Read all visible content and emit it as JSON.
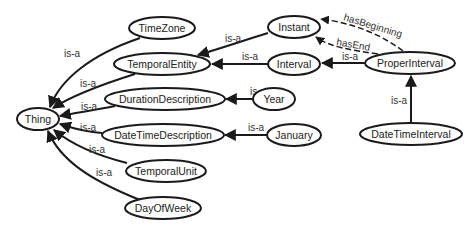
{
  "diagram": {
    "type": "ontology-class-graph",
    "nodes": [
      {
        "id": "TimeZone",
        "label": "TimeZone"
      },
      {
        "id": "Instant",
        "label": "Instant"
      },
      {
        "id": "TemporalEntity",
        "label": "TemporalEntity"
      },
      {
        "id": "Interval",
        "label": "Interval"
      },
      {
        "id": "ProperInterval",
        "label": "ProperInterval"
      },
      {
        "id": "DurationDescription",
        "label": "DurationDescription"
      },
      {
        "id": "Year",
        "label": "Year"
      },
      {
        "id": "Thing",
        "label": "Thing"
      },
      {
        "id": "DateTimeDescription",
        "label": "DateTimeDescription"
      },
      {
        "id": "January",
        "label": "January"
      },
      {
        "id": "DateTimeInterval",
        "label": "DateTimeInterval"
      },
      {
        "id": "TemporalUnit",
        "label": "TemporalUnit"
      },
      {
        "id": "DayOfWeek",
        "label": "DayOfWeek"
      }
    ],
    "edges": [
      {
        "from": "TimeZone",
        "to": "Thing",
        "label": "is-a",
        "style": "solid"
      },
      {
        "from": "TemporalEntity",
        "to": "Thing",
        "label": "is-a",
        "style": "solid"
      },
      {
        "from": "DurationDescription",
        "to": "Thing",
        "label": "is-a",
        "style": "solid"
      },
      {
        "from": "DateTimeDescription",
        "to": "Thing",
        "label": "is-a",
        "style": "solid"
      },
      {
        "from": "TemporalUnit",
        "to": "Thing",
        "label": "is-a",
        "style": "solid"
      },
      {
        "from": "DayOfWeek",
        "to": "Thing",
        "label": "is-a",
        "style": "solid"
      },
      {
        "from": "Instant",
        "to": "TemporalEntity",
        "label": "is-a",
        "style": "solid"
      },
      {
        "from": "Interval",
        "to": "TemporalEntity",
        "label": "is-a",
        "style": "solid"
      },
      {
        "from": "ProperInterval",
        "to": "Interval",
        "label": "is-a",
        "style": "solid"
      },
      {
        "from": "Year",
        "to": "DurationDescription",
        "label": "is-a",
        "style": "solid"
      },
      {
        "from": "January",
        "to": "DateTimeDescription",
        "label": "is-a",
        "style": "solid"
      },
      {
        "from": "DateTimeInterval",
        "to": "ProperInterval",
        "label": "is-a",
        "style": "solid"
      },
      {
        "from": "ProperInterval",
        "to": "Instant",
        "label": "hasBeginning",
        "style": "dashed"
      },
      {
        "from": "ProperInterval",
        "to": "Instant",
        "label": "hasEnd",
        "style": "dashed"
      }
    ]
  },
  "labels": {
    "n_timezone": "TimeZone",
    "n_instant": "Instant",
    "n_temporalentity": "TemporalEntity",
    "n_interval": "Interval",
    "n_properinterval": "ProperInterval",
    "n_durationdescription": "DurationDescription",
    "n_year": "Year",
    "n_thing": "Thing",
    "n_datetimedescription": "DateTimeDescription",
    "n_january": "January",
    "n_datetimeinterval": "DateTimeInterval",
    "n_temporalunit": "TemporalUnit",
    "n_dayofweek": "DayOfWeek",
    "isa": "is-a",
    "hasBeginning": "hasBeginning",
    "hasEnd": "hasEnd"
  },
  "colors": {
    "stroke": "#1a1a1a",
    "background": "#ffffff",
    "text": "#222222"
  }
}
